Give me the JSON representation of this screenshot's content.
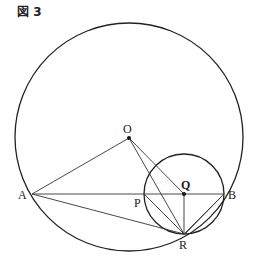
{
  "figure": {
    "title": "図 3",
    "labels": {
      "O": "O",
      "A": "A",
      "B": "B",
      "P": "P",
      "Q": "Q",
      "R": "R"
    },
    "points": {
      "O": [
        129,
        138
      ],
      "A": [
        32,
        194
      ],
      "B": [
        224,
        194
      ],
      "P": [
        144,
        194
      ],
      "Q": [
        184,
        194
      ],
      "R": [
        184,
        234
      ]
    },
    "circles": [
      {
        "name": "large circle centered at O",
        "center": [
          129,
          137
        ],
        "radius": 114
      },
      {
        "name": "small circle centered at Q",
        "center": [
          184,
          194
        ],
        "radius": 40
      }
    ],
    "segments": [
      "OA",
      "OR",
      "OQ",
      "AB",
      "AR",
      "PR",
      "QR",
      "BR"
    ]
  }
}
